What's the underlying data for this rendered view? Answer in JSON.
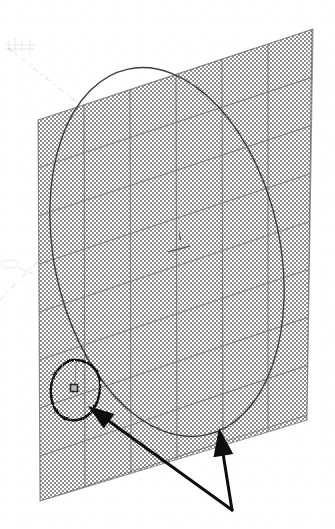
{
  "figure": {
    "title": "Scanned engineering diagram",
    "background_color": "#ffffff",
    "ink_color": "#1a1a1a",
    "plane_fill_color": "#b9b9b9",
    "plane_edge_color": "#6e6e6e",
    "grid_line_color": "#6a6a6a",
    "ellipse_stroke_color": "#3d3d3d",
    "annotation_color": "#0d0d0d",
    "axis_line_color": "#c9c9c9"
  },
  "plane": {
    "name": "shaded-grid-plane",
    "fill": "#b9b9b9",
    "corners": [
      {
        "label": "top-left",
        "x": 38,
        "y": 120
      },
      {
        "label": "top-right",
        "x": 313,
        "y": 29
      },
      {
        "label": "bottom-right",
        "x": 307,
        "y": 420
      },
      {
        "label": "bottom-left",
        "x": 40,
        "y": 501
      }
    ],
    "vertical_grid_count": 6,
    "diagonal_grid_count": 9
  },
  "ellipse": {
    "name": "large-tilted-ellipse",
    "center_x": 167,
    "center_y": 252,
    "radius_x": 113,
    "radius_y": 187,
    "rotation_deg": -12,
    "stroke_width": 1.4,
    "stroke": "#3d3d3d"
  },
  "center_marker": {
    "name": "center-tick-mark",
    "x": 180,
    "y": 234,
    "label": ""
  },
  "node_marker": {
    "name": "square-node-marker",
    "x": 74,
    "y": 388,
    "size": 7,
    "stroke": "#2a2a2a"
  },
  "annotation_circle": {
    "name": "hand-drawn-circle-annotation",
    "center_x": 76,
    "center_y": 390,
    "radius_x": 24,
    "radius_y": 30,
    "rotation_deg": 18,
    "stroke_width": 2.2
  },
  "arrows": [
    {
      "name": "arrow-to-node-marker",
      "from_x": 232,
      "from_y": 510,
      "to_x": 88,
      "to_y": 406,
      "head_length": 26,
      "head_width": 18,
      "stroke_width": 3.0
    },
    {
      "name": "arrow-to-ellipse-edge",
      "from_x": 232,
      "from_y": 510,
      "to_x": 219,
      "to_y": 428,
      "head_length": 28,
      "head_width": 20,
      "stroke_width": 3.0
    }
  ],
  "axis_lines": [
    {
      "name": "faint-axis-line-upper",
      "x1": 8,
      "y1": 48,
      "x2": 150,
      "y2": 160,
      "dash": "6 4 2 4"
    },
    {
      "name": "faint-axis-line-lower",
      "x1": 0,
      "y1": 300,
      "x2": 62,
      "y2": 236,
      "dash": "6 4 2 4"
    },
    {
      "name": "faint-axis-line-interior",
      "x1": 104,
      "y1": 118,
      "x2": 176,
      "y2": 172,
      "dash": "5 4 2 4"
    }
  ],
  "scan_artifacts": [
    {
      "name": "faint-scan-smudge-top-left",
      "x": 8,
      "y": 38,
      "width": 34,
      "height": 16
    },
    {
      "name": "faint-scan-smudge-left-middle",
      "x": 2,
      "y": 258,
      "width": 30,
      "height": 14
    }
  ]
}
